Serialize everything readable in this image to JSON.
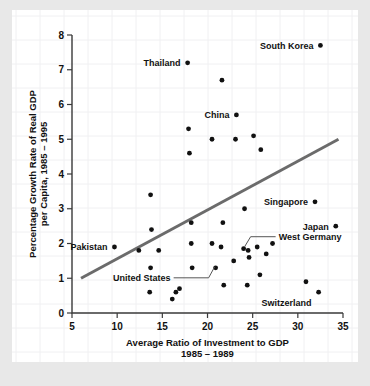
{
  "chart_data": {
    "type": "scatter",
    "title": "",
    "xlabel": "Average Ratio of Investment to GDP",
    "xlabel_line2": "1985 – 1989",
    "ylabel": "Percentage Growth Rate of Real GDP",
    "ylabel_line2": "per Capita, 1985 – 1995",
    "xlim": [
      5,
      35
    ],
    "ylim": [
      0,
      8
    ],
    "xticks": [
      5,
      10,
      15,
      20,
      25,
      30,
      35
    ],
    "xtick_labels": [
      "5",
      "10",
      "15",
      "20",
      "25",
      "30",
      "35"
    ],
    "yticks": [
      0,
      1,
      2,
      3,
      4,
      5,
      6,
      7,
      8
    ],
    "ytick_labels": [
      "0",
      "1",
      "2",
      "3",
      "4",
      "5",
      "6",
      "7",
      "8"
    ],
    "grid": true,
    "legend": "none",
    "point_color": "#111111",
    "trend_color": "#6b6b6b",
    "trendline": {
      "x0": 6.0,
      "y0": 1.0,
      "x1": 34.5,
      "y1": 5.0,
      "label": "fitted trend line"
    },
    "points": [
      {
        "x": 9.7,
        "y": 1.9,
        "label": "Pakistan",
        "label_pos": "left"
      },
      {
        "x": 12.4,
        "y": 1.8,
        "label": "",
        "label_pos": ""
      },
      {
        "x": 13.7,
        "y": 3.4,
        "label": "",
        "label_pos": ""
      },
      {
        "x": 13.8,
        "y": 2.4,
        "label": "",
        "label_pos": ""
      },
      {
        "x": 13.7,
        "y": 1.3,
        "label": "",
        "label_pos": ""
      },
      {
        "x": 13.6,
        "y": 0.6,
        "label": "",
        "label_pos": ""
      },
      {
        "x": 14.6,
        "y": 1.8,
        "label": "",
        "label_pos": ""
      },
      {
        "x": 16.1,
        "y": 0.4,
        "label": "",
        "label_pos": ""
      },
      {
        "x": 16.5,
        "y": 0.6,
        "label": "",
        "label_pos": ""
      },
      {
        "x": 16.9,
        "y": 0.7,
        "label": "",
        "label_pos": ""
      },
      {
        "x": 17.8,
        "y": 7.2,
        "label": "Thailand",
        "label_pos": "left"
      },
      {
        "x": 17.9,
        "y": 5.3,
        "label": "",
        "label_pos": ""
      },
      {
        "x": 18.0,
        "y": 4.6,
        "label": "",
        "label_pos": ""
      },
      {
        "x": 18.2,
        "y": 2.6,
        "label": "",
        "label_pos": ""
      },
      {
        "x": 18.2,
        "y": 2.0,
        "label": "",
        "label_pos": ""
      },
      {
        "x": 18.3,
        "y": 1.3,
        "label": "",
        "label_pos": ""
      },
      {
        "x": 20.5,
        "y": 5.0,
        "label": "",
        "label_pos": ""
      },
      {
        "x": 20.5,
        "y": 2.0,
        "label": "",
        "label_pos": ""
      },
      {
        "x": 20.9,
        "y": 1.3,
        "label": "United States",
        "label_pos": "leader-left"
      },
      {
        "x": 21.6,
        "y": 6.7,
        "label": "",
        "label_pos": ""
      },
      {
        "x": 21.5,
        "y": 1.9,
        "label": "",
        "label_pos": ""
      },
      {
        "x": 21.7,
        "y": 2.6,
        "label": "",
        "label_pos": ""
      },
      {
        "x": 21.8,
        "y": 0.8,
        "label": "",
        "label_pos": ""
      },
      {
        "x": 23.1,
        "y": 5.0,
        "label": "",
        "label_pos": ""
      },
      {
        "x": 23.2,
        "y": 5.7,
        "label": "China",
        "label_pos": "left"
      },
      {
        "x": 22.9,
        "y": 1.5,
        "label": "",
        "label_pos": ""
      },
      {
        "x": 24.1,
        "y": 3.0,
        "label": "",
        "label_pos": ""
      },
      {
        "x": 24.0,
        "y": 1.85,
        "label": "West Germany",
        "label_pos": "leader-right"
      },
      {
        "x": 24.5,
        "y": 1.8,
        "label": "",
        "label_pos": ""
      },
      {
        "x": 24.6,
        "y": 1.6,
        "label": "",
        "label_pos": ""
      },
      {
        "x": 24.4,
        "y": 0.8,
        "label": "",
        "label_pos": ""
      },
      {
        "x": 25.1,
        "y": 5.1,
        "label": "",
        "label_pos": ""
      },
      {
        "x": 25.5,
        "y": 1.9,
        "label": "",
        "label_pos": ""
      },
      {
        "x": 25.9,
        "y": 4.7,
        "label": "",
        "label_pos": ""
      },
      {
        "x": 25.8,
        "y": 1.1,
        "label": "",
        "label_pos": ""
      },
      {
        "x": 26.5,
        "y": 1.7,
        "label": "",
        "label_pos": ""
      },
      {
        "x": 27.2,
        "y": 2.0,
        "label": "",
        "label_pos": ""
      },
      {
        "x": 30.9,
        "y": 0.9,
        "label": "",
        "label_pos": ""
      },
      {
        "x": 31.9,
        "y": 3.2,
        "label": "Singapore",
        "label_pos": "left"
      },
      {
        "x": 32.3,
        "y": 0.6,
        "label": "Switzerland",
        "label_pos": "below-left"
      },
      {
        "x": 32.5,
        "y": 7.7,
        "label": "South Korea",
        "label_pos": "left"
      },
      {
        "x": 34.2,
        "y": 2.5,
        "label": "Japan",
        "label_pos": "left"
      }
    ],
    "annotations": [
      {
        "text": "Pakistan",
        "x": 9.7,
        "y": 1.9
      },
      {
        "text": "Thailand",
        "x": 17.8,
        "y": 7.2
      },
      {
        "text": "China",
        "x": 23.2,
        "y": 5.7
      },
      {
        "text": "South Korea",
        "x": 32.5,
        "y": 7.7
      },
      {
        "text": "Singapore",
        "x": 31.9,
        "y": 3.2
      },
      {
        "text": "Japan",
        "x": 34.2,
        "y": 2.5
      },
      {
        "text": "Switzerland",
        "x": 32.3,
        "y": 0.6
      },
      {
        "text": "West Germany",
        "x": 24.0,
        "y": 1.85
      },
      {
        "text": "United States",
        "x": 20.9,
        "y": 1.3
      }
    ]
  },
  "labels": {
    "pakistan": "Pakistan",
    "thailand": "Thailand",
    "china": "China",
    "south_korea": "South Korea",
    "singapore": "Singapore",
    "japan": "Japan",
    "switzerland": "Switzerland",
    "west_germany": "West Germany",
    "united_states": "United States"
  },
  "axes": {
    "x_title_line1": "Average Ratio of Investment to GDP",
    "x_title_line2": "1985 – 1989",
    "y_title_line1": "Percentage Growth Rate of Real GDP",
    "y_title_line2": "per Capita, 1985 – 1995"
  }
}
